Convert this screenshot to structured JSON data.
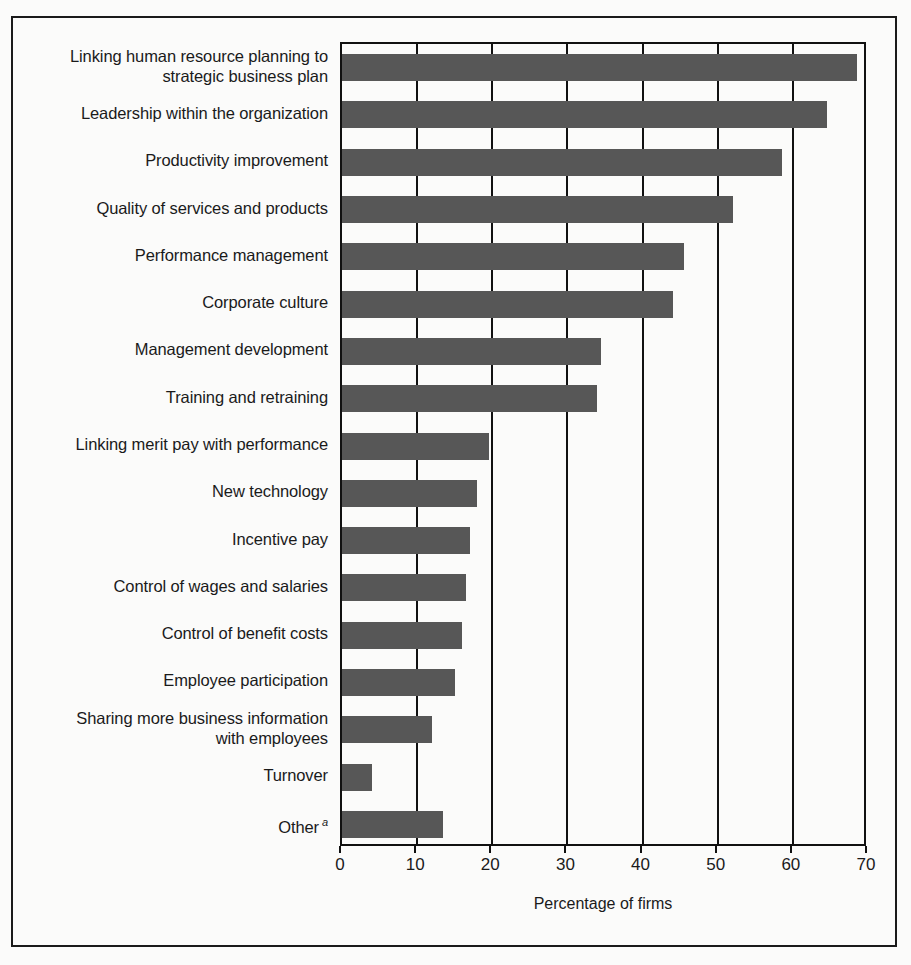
{
  "chart_data": {
    "type": "bar",
    "orientation": "horizontal",
    "title": "",
    "xlabel": "Percentage of firms",
    "ylabel": "",
    "xlim": [
      0,
      70
    ],
    "xticks": [
      0,
      10,
      20,
      30,
      40,
      50,
      60,
      70
    ],
    "xtick_labels": [
      "0",
      "10",
      "20",
      "30",
      "40",
      "50",
      "60",
      "70"
    ],
    "grid": "vertical",
    "legend": "none",
    "bar_color": "#575757",
    "categories": [
      "Linking human resource planning to strategic business plan",
      "Leadership within the organization",
      "Productivity improvement",
      "Quality of services and products",
      "Performance management",
      "Corporate culture",
      "Management development",
      "Training and retraining",
      "Linking merit pay with performance",
      "New technology",
      "Incentive pay",
      "Control of wages and salaries",
      "Control of benefit costs",
      "Employee participation",
      "Sharing more business information with employees",
      "Turnover",
      "Other"
    ],
    "values": [
      68.5,
      64.5,
      58.5,
      52,
      45.5,
      44,
      34.5,
      34,
      19.5,
      18,
      17,
      16.5,
      16,
      15,
      12,
      4,
      13.5
    ]
  },
  "labels": [
    {
      "line1": "Linking human resource planning to",
      "line2": "strategic business plan",
      "sup": ""
    },
    {
      "line1": "Leadership within the organization",
      "line2": "",
      "sup": ""
    },
    {
      "line1": "Productivity improvement",
      "line2": "",
      "sup": ""
    },
    {
      "line1": "Quality of services and products",
      "line2": "",
      "sup": ""
    },
    {
      "line1": "Performance management",
      "line2": "",
      "sup": ""
    },
    {
      "line1": "Corporate culture",
      "line2": "",
      "sup": ""
    },
    {
      "line1": "Management development",
      "line2": "",
      "sup": ""
    },
    {
      "line1": "Training and retraining",
      "line2": "",
      "sup": ""
    },
    {
      "line1": "Linking merit pay with performance",
      "line2": "",
      "sup": ""
    },
    {
      "line1": "New technology",
      "line2": "",
      "sup": ""
    },
    {
      "line1": "Incentive pay",
      "line2": "",
      "sup": ""
    },
    {
      "line1": "Control of wages and salaries",
      "line2": "",
      "sup": ""
    },
    {
      "line1": "Control of benefit costs",
      "line2": "",
      "sup": ""
    },
    {
      "line1": "Employee participation",
      "line2": "",
      "sup": ""
    },
    {
      "line1": "Sharing more business information",
      "line2": "with employees",
      "sup": ""
    },
    {
      "line1": "Turnover",
      "line2": "",
      "sup": ""
    },
    {
      "line1": "Other",
      "line2": "",
      "sup": "a"
    }
  ],
  "axis": {
    "x_title": "Percentage of firms"
  }
}
